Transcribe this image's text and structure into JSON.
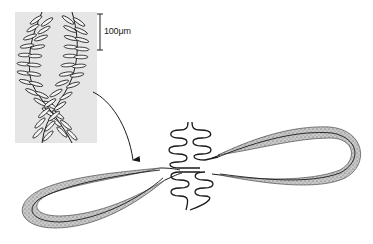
{
  "figure": {
    "scale_bar": {
      "label": "100μm"
    },
    "inset": {
      "background": "#e6e6e6"
    },
    "colors": {
      "ink": "#1a1a1a",
      "stipple": "#8a8a8a",
      "loop_fill": "#cfcfcf",
      "background": "#ffffff"
    }
  }
}
